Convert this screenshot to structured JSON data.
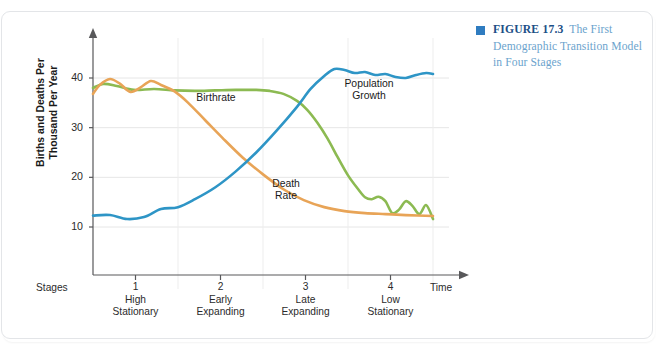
{
  "figure": {
    "bullet_color": "#2f7cc0",
    "label": "FIGURE 17.3",
    "caption": "The First Demographic Transition Model in Four Stages"
  },
  "chart_data": {
    "type": "line",
    "title": "The First Demographic Transition Model in Four Stages",
    "xlabel": "Time",
    "ylabel": "Births and Deaths Per Thousand Per Year",
    "ylim": [
      0,
      46
    ],
    "xlim": [
      0,
      100
    ],
    "grid": true,
    "y_ticks": [
      "10",
      "20",
      "30",
      "40"
    ],
    "y_tick_values": [
      10,
      20,
      30,
      40
    ],
    "stages_label": "Stages",
    "time_label": "Time",
    "legend_position": "inline-annotations",
    "stages": [
      {
        "number": "1",
        "name": "High\nStationary",
        "line1": "High",
        "line2": "Stationary"
      },
      {
        "number": "2",
        "name": "Early\nExpanding",
        "line1": "Early",
        "line2": "Expanding"
      },
      {
        "number": "3",
        "name": "Late\nExpanding",
        "line1": "Late",
        "line2": "Expanding"
      },
      {
        "number": "4",
        "name": "Low\nStationary",
        "line1": "Low",
        "line2": "Stationary"
      }
    ],
    "series": [
      {
        "name": "Birthrate",
        "color": "#8cba52",
        "label_line1": "Birthrate",
        "label_line2": "",
        "x": [
          0,
          3,
          7,
          12,
          18,
          24,
          30,
          36,
          42,
          48,
          52,
          56,
          60,
          63,
          66,
          69,
          72,
          75,
          78,
          80,
          82,
          84,
          86,
          88,
          90,
          92,
          94,
          96,
          98,
          100
        ],
        "values": [
          38.0,
          38.8,
          38.4,
          37.6,
          37.8,
          37.5,
          37.4,
          37.5,
          37.6,
          37.6,
          37.4,
          36.8,
          35.4,
          33.6,
          31.0,
          27.8,
          24.0,
          20.4,
          17.6,
          16.0,
          15.6,
          16.1,
          15.2,
          12.8,
          13.5,
          15.2,
          14.2,
          12.6,
          14.4,
          11.6
        ]
      },
      {
        "name": "Death Rate",
        "color": "#e8a457",
        "label_line1": "Death",
        "label_line2": "Rate",
        "x": [
          0,
          2,
          5,
          8,
          11,
          14,
          17,
          20,
          24,
          28,
          33,
          38,
          44,
          50,
          56,
          62,
          68,
          74,
          80,
          86,
          92,
          100
        ],
        "values": [
          36.8,
          38.6,
          39.8,
          38.8,
          37.2,
          38.1,
          39.4,
          38.6,
          37.3,
          35.0,
          31.5,
          28.0,
          24.0,
          20.6,
          17.6,
          15.4,
          14.0,
          13.2,
          12.8,
          12.6,
          12.4,
          12.2
        ]
      },
      {
        "name": "Population Growth",
        "color": "#2e95c6",
        "label_line1": "Population",
        "label_line2": "Growth",
        "x": [
          0,
          5,
          10,
          15,
          20,
          25,
          30,
          36,
          42,
          48,
          54,
          60,
          64,
          68,
          71,
          74,
          77,
          80,
          83,
          86,
          89,
          92,
          95,
          98,
          100
        ],
        "values": [
          12.3,
          12.4,
          11.6,
          12.0,
          13.6,
          14.0,
          15.6,
          18.0,
          21.2,
          25.0,
          29.4,
          34.2,
          37.8,
          40.4,
          41.8,
          41.6,
          41.0,
          41.2,
          40.6,
          40.8,
          40.2,
          40.0,
          40.6,
          41.0,
          40.8
        ]
      }
    ],
    "annotations": [
      {
        "text": "Birthrate",
        "series": "Birthrate"
      },
      {
        "text": "Death Rate",
        "series": "Death Rate"
      },
      {
        "text": "Population Growth",
        "series": "Population Growth"
      }
    ]
  }
}
